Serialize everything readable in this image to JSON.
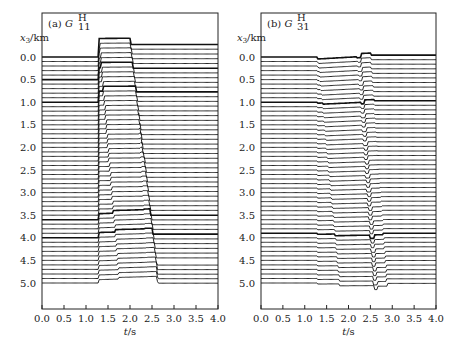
{
  "chart_data": [
    {
      "type": "line",
      "subtype": "seismogram-wiggle-traces",
      "title": "(a) G_11^H",
      "panel_label": "(a)",
      "symbol": "G",
      "subscript": "11",
      "superscript": "H",
      "xlabel": "t/s",
      "ylabel": "x3/km",
      "xlim": [
        0.0,
        4.0
      ],
      "ylim": [
        5.3,
        -0.7
      ],
      "xticks": [
        "0.0",
        "0.5",
        "1.0",
        "1.5",
        "2.0",
        "2.5",
        "3.0",
        "3.5",
        "4.0"
      ],
      "yticks": [
        "0.0",
        "0.5",
        "1.0",
        "1.5",
        "2.0",
        "2.5",
        "3.0",
        "3.5",
        "4.0",
        "4.5",
        "5.0"
      ],
      "grid": false,
      "trace_spacing_km": 0.1,
      "trace_count": 51,
      "bold_traces_km": [
        0.0,
        0.5,
        1.0,
        3.6,
        4.0
      ],
      "onset_time_s": 1.3,
      "features": {
        "direct_arrival_step_km": 0.3,
        "p_arrival_slope_s_per_km": 0.09,
        "s_arrival_start_s": 2.1,
        "s_arrival_slope_s_per_km": 0.1,
        "end_time_s": 2.6
      }
    },
    {
      "type": "line",
      "subtype": "seismogram-wiggle-traces",
      "title": "(b) G_31^H",
      "panel_label": "(b)",
      "symbol": "G",
      "subscript": "31",
      "superscript": "H",
      "xlabel": "t/s",
      "ylabel": "x3/km",
      "xlim": [
        0.0,
        4.0
      ],
      "ylim": [
        5.3,
        -0.7
      ],
      "xticks": [
        "0.0",
        "0.5",
        "1.0",
        "1.5",
        "2.0",
        "2.5",
        "3.0",
        "3.5",
        "4.0"
      ],
      "yticks": [
        "0.0",
        "0.5",
        "1.0",
        "1.5",
        "2.0",
        "2.5",
        "3.0",
        "3.5",
        "4.0",
        "4.5",
        "5.0"
      ],
      "grid": false,
      "trace_spacing_km": 0.1,
      "trace_count": 51,
      "bold_traces_km": [
        0.0,
        1.0,
        3.9
      ],
      "onset_time_s": 1.3,
      "features": {
        "p_arrival_slope_s_per_km": 0.1,
        "s_arrival_start_s": 2.2,
        "s_arrival_slope_s_per_km": 0.09,
        "end_time_s": 2.65
      }
    }
  ],
  "panels": [
    {
      "id": "a",
      "label": "(a)",
      "sym": "G",
      "sub": "11",
      "sup": "H",
      "ylabel_main": "x",
      "ylabel_sub": "3",
      "ylabel_unit": "/km",
      "xlabel_var": "t",
      "xlabel_unit": "/s"
    },
    {
      "id": "b",
      "label": "(b)",
      "sym": "G",
      "sub": "31",
      "sup": "H",
      "ylabel_main": "x",
      "ylabel_sub": "3",
      "ylabel_unit": "/km",
      "xlabel_var": "t",
      "xlabel_unit": "/s"
    }
  ]
}
